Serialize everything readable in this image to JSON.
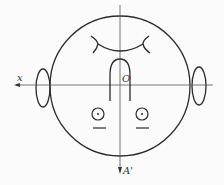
{
  "diagram": {
    "type": "schematic head figure with coordinate axes",
    "labels": {
      "x_axis": "x",
      "origin": "O",
      "vertical_axis": "A'"
    },
    "colors": {
      "stroke": "#2b2b2b",
      "axis": "#555555",
      "background": "#fbfbfb"
    }
  }
}
